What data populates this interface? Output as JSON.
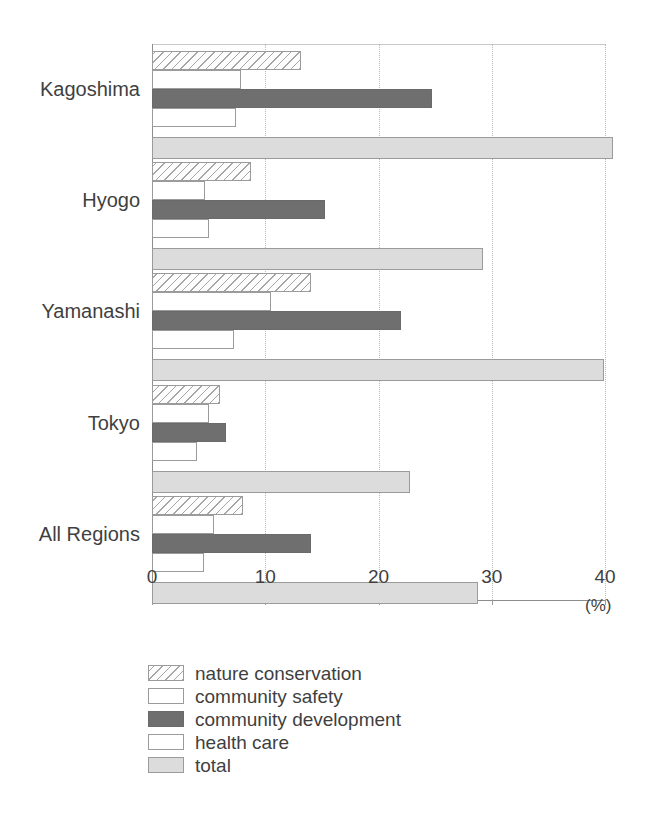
{
  "chart_data": {
    "type": "bar",
    "orientation": "horizontal",
    "title": "",
    "xlabel": "(%)",
    "ylabel": "",
    "xlim": [
      0,
      40
    ],
    "xticks": [
      0,
      10,
      20,
      30,
      40
    ],
    "xtick_labels": [
      "0",
      "10",
      "20",
      "30",
      "40"
    ],
    "grid": true,
    "legend_position": "bottom-left",
    "categories": [
      "Kagoshima",
      "Hyogo",
      "Yamanashi",
      "Tokyo",
      "All Regions"
    ],
    "series": [
      {
        "name": "nature conservation",
        "style": "hatched",
        "values": [
          13.2,
          8.7,
          14.0,
          6.0,
          8.0
        ]
      },
      {
        "name": "community safety",
        "style": "white",
        "values": [
          7.9,
          4.7,
          10.5,
          5.0,
          5.5
        ]
      },
      {
        "name": "community development",
        "style": "dark-gray",
        "values": [
          24.7,
          15.3,
          22.0,
          6.5,
          14.0
        ]
      },
      {
        "name": "health care",
        "style": "white",
        "values": [
          7.4,
          5.0,
          7.2,
          4.0,
          4.6
        ]
      },
      {
        "name": "total",
        "style": "light-gray",
        "values": [
          40.7,
          29.2,
          39.9,
          22.8,
          28.8
        ]
      }
    ]
  },
  "axis": {
    "unit": "(%)",
    "tick_labels": [
      "0",
      "10",
      "20",
      "30",
      "40"
    ]
  },
  "legend": {
    "items": [
      {
        "label": "nature conservation",
        "style": "hatched"
      },
      {
        "label": "community safety",
        "style": "white"
      },
      {
        "label": "community development",
        "style": "dark-gray"
      },
      {
        "label": "health care",
        "style": "white"
      },
      {
        "label": "total",
        "style": "light-gray"
      }
    ]
  },
  "colors": {
    "dark_gray": "#6f6f6f",
    "light_gray": "#dcdcdc",
    "white": "#ffffff",
    "hatch_line": "#969696",
    "outline": "#9b9b9b",
    "axis": "#8d8d8d",
    "grid": "#b9b9b9",
    "text": "#3f3f3f"
  }
}
